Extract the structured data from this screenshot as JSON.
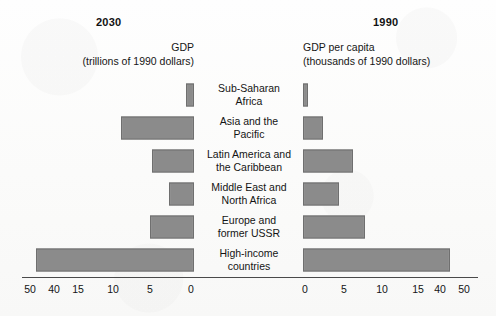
{
  "header": {
    "left": {
      "year": "2030",
      "title": "GDP",
      "units": "(trillions of 1990 dollars)"
    },
    "right": {
      "year": "1990",
      "title": "GDP per capita",
      "units": "(thousands of 1990 dollars)"
    }
  },
  "categories": [
    {
      "line1": "Sub-Saharan",
      "line2": "Africa"
    },
    {
      "line1": "Asia and the",
      "line2": "Pacific"
    },
    {
      "line1": "Latin America and",
      "line2": "the Caribbean"
    },
    {
      "line1": "Middle East and",
      "line2": "North Africa"
    },
    {
      "line1": "Europe and",
      "line2": "former USSR"
    },
    {
      "line1": "High-income",
      "line2": "countries"
    }
  ],
  "axis": {
    "left_ticks": [
      "50",
      "40",
      "15",
      "10",
      "5",
      "0"
    ],
    "right_ticks": [
      "0",
      "5",
      "10",
      "15",
      "40",
      "50"
    ],
    "left_tick_x": [
      30,
      54,
      78,
      113,
      150,
      191
    ],
    "right_tick_x": [
      305,
      344,
      382,
      418,
      440,
      464
    ]
  },
  "colors": {
    "bar_fill": "#8b8b8b",
    "bar_stroke": "#6f6f6f",
    "axis": "#4a4a4a",
    "text": "#141414",
    "background": "#fdfdfc"
  },
  "geometry": {
    "left_zero_x": 194,
    "right_zero_x": 303,
    "row_top": 78,
    "row_height": 33,
    "bar_height": 23,
    "left_bar_px": [
      8,
      73,
      42,
      25,
      44,
      158
    ],
    "right_bar_px": [
      5,
      20,
      50,
      36,
      62,
      147
    ]
  },
  "chart_data": {
    "type": "bar",
    "orientation": "horizontal-diverging",
    "categories": [
      "Sub-Saharan Africa",
      "Asia and the Pacific",
      "Latin America and the Caribbean",
      "Middle East and North Africa",
      "Europe and former USSR",
      "High-income countries"
    ],
    "series": [
      {
        "name": "GDP",
        "year": "2030",
        "side": "left",
        "ylabel": "GDP",
        "units": "trillions of 1990 dollars",
        "direction": "right-to-left",
        "values": [
          1.2,
          11.0,
          6.3,
          3.8,
          6.6,
          48.0
        ]
      },
      {
        "name": "GDP per capita",
        "year": "1990",
        "side": "right",
        "ylabel": "GDP per capita",
        "units": "thousands of 1990 dollars",
        "direction": "left-to-right",
        "values": [
          0.8,
          3.0,
          7.5,
          5.4,
          9.3,
          42.0
        ]
      }
    ],
    "xlabel": "",
    "ylabel": "",
    "axis_ticks_left": [
      50,
      40,
      15,
      10,
      5,
      0
    ],
    "axis_ticks_right": [
      0,
      5,
      10,
      15,
      40,
      50
    ],
    "axis_note": "broken (compressed) scale above 15",
    "xlim": [
      0,
      50
    ],
    "grid": false,
    "legend": "none"
  }
}
